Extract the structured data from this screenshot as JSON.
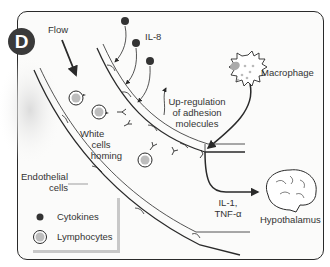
{
  "panel": {
    "badge_letter": "D"
  },
  "labels": {
    "flow": "Flow",
    "il8": "IL-8",
    "macrophage": "Macrophage",
    "upregulation_line1": "Up-regulation",
    "upregulation_line2": "of adhesion",
    "upregulation_line3": "molecules",
    "white_line1": "White",
    "white_line2": "cells",
    "white_line3": "homing",
    "endothelial_line1": "Endothelial",
    "endothelial_line2": "cells",
    "il1": "IL-1,",
    "tnf": "TNF-α",
    "hypothalamus": "Hypothalamus"
  },
  "legend": {
    "items": [
      {
        "symbol": "cytokine-dot",
        "label": "Cytokines"
      },
      {
        "symbol": "lymphocyte-circle",
        "label": "Lymphocytes"
      }
    ]
  },
  "colors": {
    "line": "#2a2a2a",
    "cytokine": "#333333",
    "cell_fill": "#bdbdbd",
    "shadow": "#e9e9e9"
  }
}
